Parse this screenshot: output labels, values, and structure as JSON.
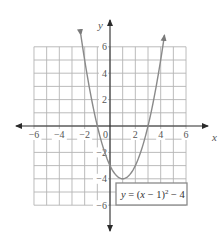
{
  "chart_data": {
    "type": "line",
    "title": "",
    "xlabel": "x",
    "ylabel": "y",
    "xlim": [
      -6,
      6
    ],
    "ylim": [
      -6,
      6
    ],
    "grid": true,
    "grid_step": 1,
    "x_ticks": [
      -6,
      -4,
      -2,
      0,
      2,
      4,
      6
    ],
    "x_tick_labels": [
      "−6",
      "−4",
      "−2",
      "0",
      "2",
      "4",
      "6"
    ],
    "y_ticks": [
      6,
      4,
      2,
      -2,
      -4,
      -6
    ],
    "y_tick_labels": [
      "6",
      "4",
      "2",
      "−2",
      "−4",
      "−6"
    ],
    "series": [
      {
        "name": "y = (x − 1)^2 − 4",
        "equation": "y = (x - 1)^2 - 4",
        "vertex": [
          1,
          -4
        ],
        "x_intercepts": [
          -1,
          3
        ],
        "y_intercept": -3,
        "x": [
          -2.3,
          -2,
          -1,
          0,
          1,
          2,
          3,
          4,
          4.3
        ],
        "y": [
          6.9,
          5,
          0,
          -3,
          -4,
          -3,
          0,
          5,
          6.9
        ],
        "arrows_at_ends": true
      }
    ],
    "annotations": [
      {
        "text": "y = (x − 1)² − 4",
        "position": "lower-right",
        "boxed": true
      }
    ]
  },
  "labels": {
    "x_axis": "x",
    "y_axis": "y",
    "eq_y": "y",
    "eq_eq": " = (",
    "eq_x": "x",
    "eq_mid": " − 1)",
    "eq_sup": "2",
    "eq_end": " − 4"
  },
  "colors": {
    "grid": "#b4b4b4",
    "axis": "#2a2a2a",
    "curve": "#8a8a8a",
    "text": "#555555"
  }
}
